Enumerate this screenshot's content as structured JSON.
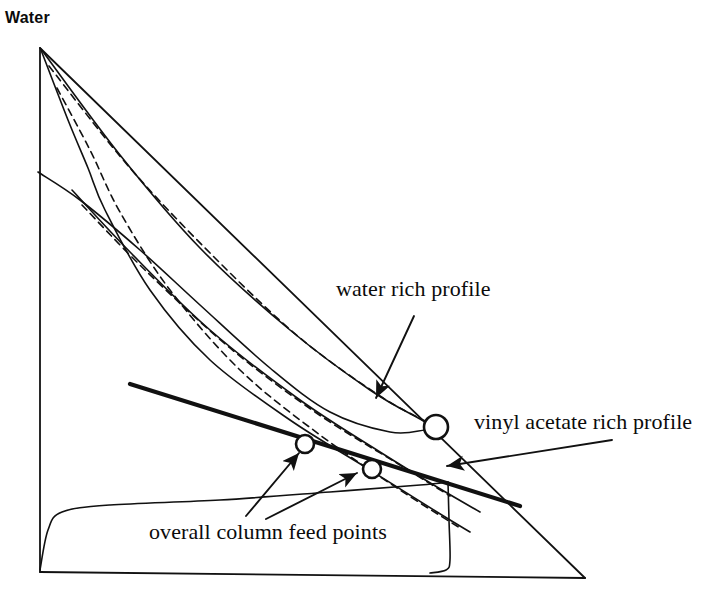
{
  "figure": {
    "kind": "ternary-residue-curve-map",
    "title_visible": false,
    "background_color": "#ffffff",
    "line_color": "#111111",
    "width": 719,
    "height": 602
  },
  "vertex_labels": {
    "top": "Water"
  },
  "annotations": [
    {
      "id": "water-rich-profile",
      "text": "water rich profile"
    },
    {
      "id": "vinyl-acetate-rich-profile",
      "text": "vinyl acetate rich profile"
    },
    {
      "id": "overall-column-feed-points",
      "text": "overall column feed points"
    }
  ],
  "chart_data": {
    "type": "line",
    "title": "",
    "xlabel": "",
    "ylabel": "",
    "grid": false,
    "legend_position": "none",
    "axis_ranges": {
      "x": [
        0,
        1
      ],
      "y": [
        0,
        1
      ]
    },
    "triangle": {
      "apex_top": [
        40,
        48
      ],
      "vertex_left": [
        40,
        572
      ],
      "vertex_right": [
        585,
        578
      ]
    },
    "series": [
      {
        "name": "hypotenuse",
        "style": "solid",
        "width": 1.8,
        "points": [
          [
            40,
            48
          ],
          [
            585,
            578
          ]
        ]
      },
      {
        "name": "left-edge",
        "style": "solid",
        "width": 1.8,
        "points": [
          [
            40,
            48
          ],
          [
            40,
            572
          ]
        ]
      },
      {
        "name": "bottom-edge",
        "style": "solid",
        "width": 1.8,
        "points": [
          [
            40,
            572
          ],
          [
            585,
            578
          ]
        ]
      },
      {
        "name": "water-rich-profile-solid",
        "style": "solid",
        "width": 1.6,
        "points": [
          [
            41,
            49
          ],
          [
            120,
            155
          ],
          [
            200,
            248
          ],
          [
            290,
            330
          ],
          [
            370,
            390
          ],
          [
            420,
            419
          ],
          [
            437,
            428
          ]
        ]
      },
      {
        "name": "water-rich-profile-dashed",
        "style": "dashed",
        "width": 1.6,
        "points": [
          [
            49,
            66
          ],
          [
            130,
            168
          ],
          [
            215,
            258
          ],
          [
            300,
            338
          ],
          [
            380,
            396
          ],
          [
            425,
            421
          ],
          [
            437,
            428
          ]
        ]
      },
      {
        "name": "vinyl-acetate-rich-profile-solid",
        "style": "solid",
        "width": 1.6,
        "points": [
          [
            41,
            50
          ],
          [
            68,
            120
          ],
          [
            88,
            168
          ],
          [
            105,
            210
          ],
          [
            150,
            290
          ],
          [
            210,
            360
          ],
          [
            290,
            420
          ],
          [
            370,
            470
          ],
          [
            437,
            512
          ],
          [
            470,
            532
          ]
        ]
      },
      {
        "name": "vinyl-acetate-rich-profile-dashed",
        "style": "dashed",
        "width": 1.6,
        "points": [
          [
            57,
            88
          ],
          [
            90,
            150
          ],
          [
            120,
            212
          ],
          [
            170,
            290
          ],
          [
            240,
            370
          ],
          [
            320,
            435
          ],
          [
            400,
            490
          ],
          [
            460,
            528
          ]
        ]
      },
      {
        "name": "middle-profile-solid",
        "style": "solid",
        "width": 1.6,
        "points": [
          [
            72,
            190
          ],
          [
            130,
            252
          ],
          [
            210,
            330
          ],
          [
            300,
            400
          ],
          [
            380,
            452
          ],
          [
            437,
            487
          ],
          [
            480,
            512
          ]
        ]
      },
      {
        "name": "middle-profile-dashed",
        "style": "dashed",
        "width": 1.6,
        "points": [
          [
            82,
            205
          ],
          [
            145,
            270
          ],
          [
            230,
            348
          ],
          [
            315,
            412
          ],
          [
            395,
            462
          ],
          [
            450,
            496
          ]
        ]
      },
      {
        "name": "binodal-upper-branch",
        "style": "solid",
        "width": 1.6,
        "points": [
          [
            38,
            172
          ],
          [
            80,
            200
          ],
          [
            140,
            250
          ],
          [
            200,
            305
          ],
          [
            270,
            368
          ],
          [
            330,
            412
          ],
          [
            390,
            432
          ],
          [
            425,
            430
          ],
          [
            437,
            427
          ]
        ]
      },
      {
        "name": "binodal-lower-envelope",
        "style": "solid",
        "width": 1.6,
        "points": [
          [
            40,
            570
          ],
          [
            48,
            530
          ],
          [
            62,
            512
          ],
          [
            110,
            505
          ],
          [
            220,
            500
          ],
          [
            330,
            492
          ],
          [
            420,
            485
          ],
          [
            448,
            482
          ]
        ]
      },
      {
        "name": "binodal-right-leg",
        "style": "solid",
        "width": 1.6,
        "points": [
          [
            448,
            482
          ],
          [
            449,
            520
          ],
          [
            450,
            560
          ],
          [
            446,
            570
          ],
          [
            430,
            573
          ]
        ]
      },
      {
        "name": "mass-balance-line",
        "style": "solid-thick",
        "width": 4.2,
        "points": [
          [
            130,
            384
          ],
          [
            520,
            506
          ]
        ]
      }
    ],
    "marked_points": [
      {
        "id": "feed-point-1",
        "marker": "open-circle",
        "x": 305,
        "y": 444,
        "r": 9
      },
      {
        "id": "feed-point-2",
        "marker": "open-circle",
        "x": 372,
        "y": 469,
        "r": 9
      },
      {
        "id": "profile-junction-point",
        "marker": "open-circle",
        "x": 436,
        "y": 427,
        "r": 12
      }
    ],
    "leader_lines": [
      {
        "for": "water-rich-profile",
        "from": [
          414,
          316
        ],
        "to": [
          376,
          398
        ]
      },
      {
        "for": "vinyl-acetate-rich-profile",
        "from": [
          612,
          440
        ],
        "to": [
          447,
          466
        ]
      },
      {
        "for": "overall-column-feed-points",
        "from": [
          246,
          516
        ],
        "to": [
          299,
          453
        ]
      },
      {
        "for": "overall-column-feed-points",
        "from": [
          266,
          519
        ],
        "to": [
          357,
          473
        ]
      }
    ]
  }
}
